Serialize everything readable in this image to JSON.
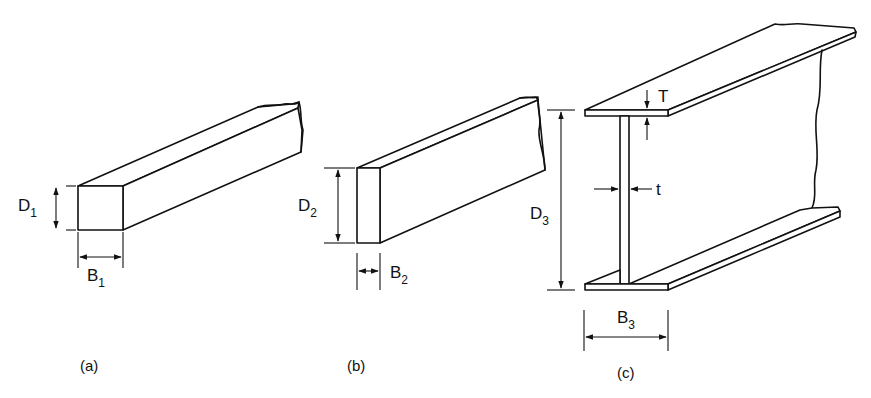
{
  "figure": {
    "panels": [
      {
        "id": "a",
        "caption": "(a)",
        "shape": "square solid bar",
        "depth_label": {
          "main": "D",
          "sub": "1"
        },
        "breadth_label": {
          "main": "B",
          "sub": "1"
        }
      },
      {
        "id": "b",
        "caption": "(b)",
        "shape": "rectangular solid bar",
        "depth_label": {
          "main": "D",
          "sub": "2"
        },
        "breadth_label": {
          "main": "B",
          "sub": "2"
        }
      },
      {
        "id": "c",
        "caption": "(c)",
        "shape": "I-beam",
        "depth_label": {
          "main": "D",
          "sub": "3"
        },
        "breadth_label": {
          "main": "B",
          "sub": "3"
        },
        "flange_thickness_label": "T",
        "web_thickness_label": "t"
      }
    ]
  }
}
